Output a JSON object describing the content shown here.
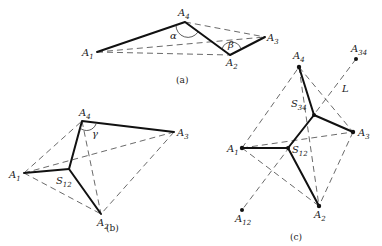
{
  "figure": {
    "panels": [
      {
        "caption": "(a)",
        "points": {
          "A1": "A1",
          "A2": "A2",
          "A3": "A3",
          "A4": "A4"
        },
        "angles": {
          "alpha": "α",
          "beta": "β"
        }
      },
      {
        "caption": "(b)",
        "points": {
          "A1": "A1",
          "A2": "A2",
          "A3": "A3",
          "A4": "A4",
          "S12": "S12"
        },
        "angles": {
          "gamma": "γ"
        }
      },
      {
        "caption": "(c)",
        "points": {
          "A1": "A1",
          "A2": "A2",
          "A3": "A3",
          "A4": "A4",
          "S12": "S12",
          "S34": "S34",
          "A12": "A12",
          "A34": "A34"
        },
        "line_label": "L"
      }
    ]
  }
}
